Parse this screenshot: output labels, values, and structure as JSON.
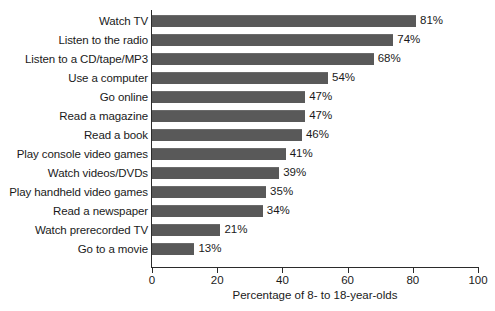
{
  "chart_data": {
    "type": "bar",
    "orientation": "horizontal",
    "title": "",
    "subtitle": "",
    "xlabel": "Percentage of 8- to 18-year-olds",
    "ylabel": "",
    "xlim": [
      0,
      100
    ],
    "xticks": [
      0,
      20,
      40,
      60,
      80,
      100
    ],
    "xtick_labels": [
      "0",
      "20",
      "40",
      "60",
      "80",
      "100"
    ],
    "grid": false,
    "legend": false,
    "bar_color": "#595959",
    "axis_color": "#2b2b2b",
    "categories": [
      "Watch TV",
      "Listen to the radio",
      "Listen to a CD/tape/MP3",
      "Use a computer",
      "Go online",
      "Read a magazine",
      "Read a book",
      "Play console video games",
      "Watch videos/DVDs",
      "Play handheld video games",
      "Read a newspaper",
      "Watch prerecorded TV",
      "Go to a movie"
    ],
    "values": [
      81,
      74,
      68,
      54,
      47,
      47,
      46,
      41,
      39,
      35,
      34,
      21,
      13
    ],
    "data_labels": [
      "81%",
      "74%",
      "68%",
      "54%",
      "47%",
      "47%",
      "46%",
      "41%",
      "39%",
      "35%",
      "34%",
      "21%",
      "13%"
    ]
  }
}
